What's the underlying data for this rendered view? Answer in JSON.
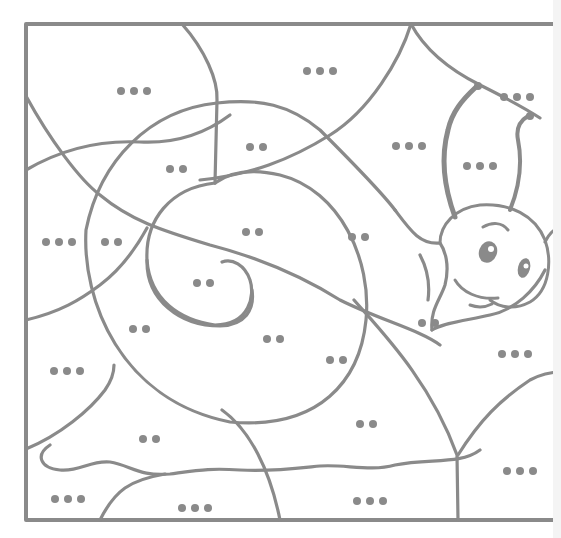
{
  "worksheet": {
    "type": "color-by-dots coloring page",
    "subject": "snail",
    "line_color": "#8a8a8a",
    "frame": {
      "x": 26,
      "y": 24,
      "width": 535,
      "height": 496
    },
    "regions": [
      {
        "id": "r1",
        "dots": 3,
        "x": 117,
        "y": 87
      },
      {
        "id": "r2",
        "dots": 3,
        "x": 303,
        "y": 67
      },
      {
        "id": "r3",
        "dots": 3,
        "x": 500,
        "y": 93
      },
      {
        "id": "r4",
        "dots": 2,
        "x": 246,
        "y": 143
      },
      {
        "id": "r5",
        "dots": 3,
        "x": 392,
        "y": 142
      },
      {
        "id": "r6",
        "dots": 3,
        "x": 463,
        "y": 162
      },
      {
        "id": "r7",
        "dots": 2,
        "x": 166,
        "y": 165
      },
      {
        "id": "r8",
        "dots": 2,
        "x": 242,
        "y": 228
      },
      {
        "id": "r9",
        "dots": 3,
        "x": 42,
        "y": 238
      },
      {
        "id": "r10",
        "dots": 2,
        "x": 101,
        "y": 238
      },
      {
        "id": "r11",
        "dots": 2,
        "x": 348,
        "y": 233
      },
      {
        "id": "r12",
        "dots": 2,
        "x": 193,
        "y": 279
      },
      {
        "id": "r13",
        "dots": 2,
        "x": 129,
        "y": 325
      },
      {
        "id": "r14",
        "dots": 2,
        "x": 263,
        "y": 335
      },
      {
        "id": "r15",
        "dots": 2,
        "x": 418,
        "y": 319
      },
      {
        "id": "r16",
        "dots": 2,
        "x": 326,
        "y": 356
      },
      {
        "id": "r17",
        "dots": 3,
        "x": 498,
        "y": 350
      },
      {
        "id": "r18",
        "dots": 3,
        "x": 50,
        "y": 367
      },
      {
        "id": "r19",
        "dots": 2,
        "x": 356,
        "y": 420
      },
      {
        "id": "r20",
        "dots": 2,
        "x": 139,
        "y": 435
      },
      {
        "id": "r21",
        "dots": 3,
        "x": 503,
        "y": 467
      },
      {
        "id": "r22",
        "dots": 3,
        "x": 51,
        "y": 495
      },
      {
        "id": "r23",
        "dots": 3,
        "x": 178,
        "y": 504
      },
      {
        "id": "r24",
        "dots": 3,
        "x": 353,
        "y": 497
      }
    ]
  }
}
